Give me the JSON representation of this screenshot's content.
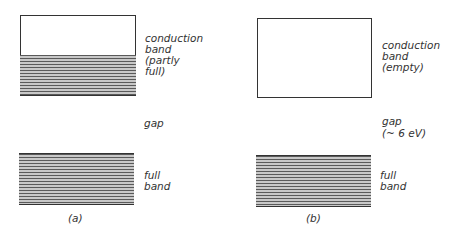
{
  "panel_a": {
    "conduction_label_1": "conduction",
    "conduction_label_2": "band",
    "conduction_label_3": "(partly",
    "conduction_label_4": "full)",
    "gap_label": "gap",
    "full_label_1": "full",
    "full_label_2": "band",
    "caption": "(a)"
  },
  "panel_b": {
    "conduction_label_1": "conduction",
    "conduction_label_2": "band",
    "conduction_label_3": "(empty)",
    "gap_label": "gap",
    "gap_value": "(~ 6 eV)",
    "full_label_1": "full",
    "full_label_2": "band",
    "caption": "(b)"
  }
}
